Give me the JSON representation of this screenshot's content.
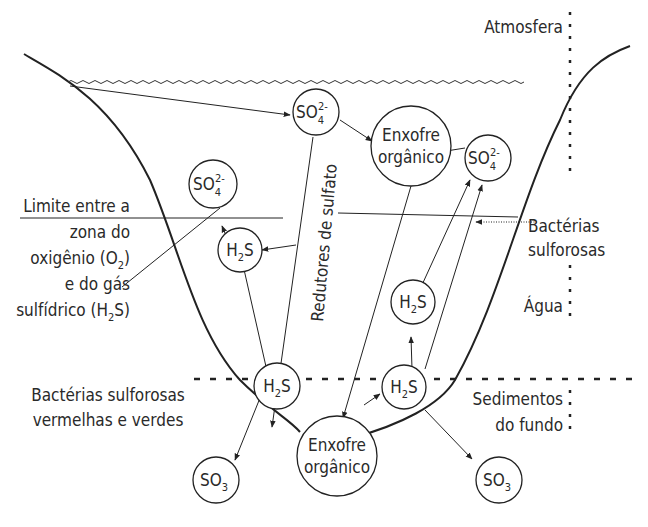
{
  "diagram": {
    "zones": {
      "atmosphere": "Atmosfera",
      "water": "Água",
      "sediments_line1": "Sedimentos",
      "sediments_line2": "do fundo"
    },
    "labels": {
      "boundary_l1": "Limite entre a",
      "boundary_l2": "zona do",
      "boundary_l3_pre": "oxigênio (O",
      "boundary_l3_sub": "2",
      "boundary_l3_post": ")",
      "boundary_l4": "e do gás",
      "boundary_l5_pre": "sulfídrico (H",
      "boundary_l5_sub": "2",
      "boundary_l5_post": "S)",
      "sulfur_bacteria_l1": "Bactérias",
      "sulfur_bacteria_l2": "sulforosas",
      "red_green_bacteria_l1": "Bactérias sulforosas",
      "red_green_bacteria_l2": "vermelhas e verdes",
      "sulfate_reducers": "Redutores de sulfato"
    },
    "nodes": {
      "so4_top": {
        "main": "SO",
        "sub": "4",
        "sup": "2-"
      },
      "so4_left": {
        "main": "SO",
        "sub": "4",
        "sup": "2-"
      },
      "so4_right": {
        "main": "SO",
        "sub": "4",
        "sup": "2-"
      },
      "org_top_l1": "Enxofre",
      "org_top_l2": "orgânico",
      "org_bottom_l1": "Enxofre",
      "org_bottom_l2": "orgânico",
      "h2s": {
        "a": "H",
        "sub": "2",
        "b": "S"
      },
      "so3": {
        "main": "SO",
        "sub": "3"
      }
    }
  }
}
